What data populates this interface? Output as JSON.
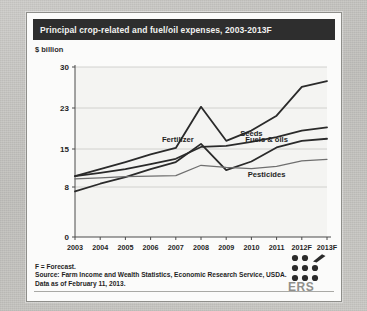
{
  "header": {
    "title": "Principal crop-related and fuel/oil expenses, 2003-2013F"
  },
  "axis_unit_label": "$ billion",
  "footer": {
    "line1": "F = Forecast.",
    "line2": "Source: Farm Income and Wealth Statistics, Economic Research Service, USDA.",
    "line3": "Data as of February 11, 2013."
  },
  "logo": {
    "name": "ERS",
    "label": "ERS"
  },
  "chart_data": {
    "type": "line",
    "title": "Principal crop-related and fuel/oil expenses, 2003-2013F",
    "subtitle": "",
    "xlabel": "",
    "ylabel": "$ billion",
    "grid": true,
    "legend": "inline-labels",
    "x": [
      "2003",
      "2004",
      "2005",
      "2006",
      "2007",
      "2008",
      "2009",
      "2010",
      "2011",
      "2012F",
      "2013F"
    ],
    "yticks": [
      0,
      8,
      15,
      23,
      30
    ],
    "ylim": [
      0,
      30
    ],
    "series": [
      {
        "name": "Fertilizer",
        "color": "#2a2a2a",
        "label_x": "2007",
        "values": [
          10.0,
          11.3,
          12.6,
          14.0,
          15.2,
          23.2,
          16.6,
          18.6,
          21.5,
          26.6,
          27.6
        ]
      },
      {
        "name": "Seeds",
        "color": "#2a2a2a",
        "label_x": "2010",
        "values": [
          10.0,
          10.6,
          11.3,
          12.2,
          13.2,
          15.4,
          15.6,
          16.4,
          17.3,
          18.6,
          19.2
        ]
      },
      {
        "name": "Fuels & oils",
        "color": "#2a2a2a",
        "label_x": "2011",
        "values": [
          7.3,
          8.6,
          9.8,
          11.3,
          12.6,
          16.0,
          11.1,
          12.7,
          15.3,
          16.6,
          17.0
        ]
      },
      {
        "name": "Pesticides",
        "color": "#6f6f6f",
        "label_x": "2011",
        "values": [
          9.5,
          9.7,
          9.9,
          10.0,
          10.1,
          12.0,
          11.6,
          11.4,
          11.8,
          12.8,
          13.1
        ]
      }
    ]
  }
}
